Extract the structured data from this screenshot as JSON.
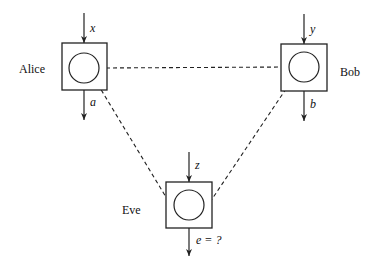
{
  "diagram": {
    "parties": [
      {
        "name": "Alice",
        "input": "x",
        "output": "a"
      },
      {
        "name": "Bob",
        "input": "y",
        "output": "b"
      },
      {
        "name": "Eve",
        "input": "z",
        "output": "e = ?"
      }
    ],
    "links": [
      "Alice-Bob",
      "Alice-Eve",
      "Bob-Eve"
    ]
  }
}
